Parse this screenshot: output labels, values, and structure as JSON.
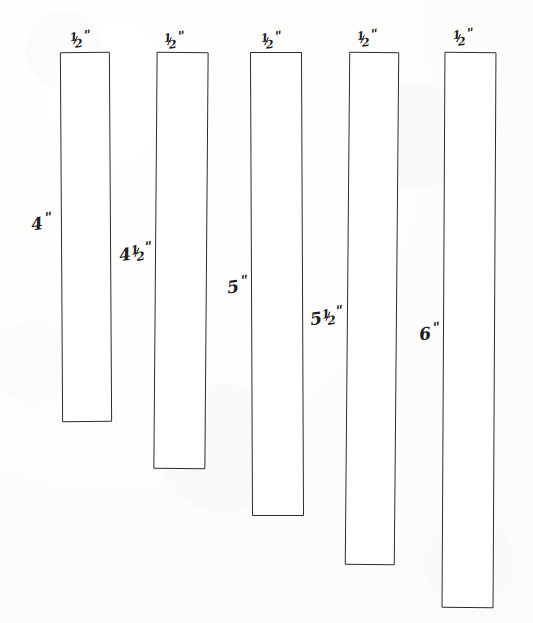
{
  "figure": {
    "kind": "hand-drawn-dimension-diagram",
    "medium": "pen on white paper",
    "background_color": "#fdfdfc",
    "ink_color": "#2b2b2b",
    "fill_color": "#ffffff",
    "units": "inches",
    "inch_symbol": "\"",
    "strip_count": 5,
    "alignment": "top-aligned, increasing length left to right"
  },
  "strips": [
    {
      "index": 1,
      "width_label": "½\"",
      "width_value": 0.5,
      "height_label": "4\"",
      "height_value": 4,
      "width_whole": "",
      "width_num": "1",
      "width_den": "2",
      "height_whole": "4",
      "height_num": "",
      "height_den": "",
      "x": 61,
      "y": 52,
      "w": 50,
      "h": 370
    },
    {
      "index": 2,
      "width_label": "½\"",
      "width_value": 0.5,
      "height_label": "4½\"",
      "height_value": 4.5,
      "width_whole": "",
      "width_num": "1",
      "width_den": "2",
      "height_whole": "4",
      "height_num": "1",
      "height_den": "2",
      "x": 155,
      "y": 52,
      "w": 52,
      "h": 417
    },
    {
      "index": 3,
      "width_label": "½\"",
      "width_value": 0.5,
      "height_label": "5\"",
      "height_value": 5,
      "width_whole": "",
      "width_num": "1",
      "width_den": "2",
      "height_whole": "5",
      "height_num": "",
      "height_den": "",
      "x": 251,
      "y": 52,
      "w": 52,
      "h": 464
    },
    {
      "index": 4,
      "width_label": "½\"",
      "width_value": 0.5,
      "height_label": "5½\"",
      "height_value": 5.5,
      "width_whole": "",
      "width_num": "1",
      "width_den": "2",
      "height_whole": "5",
      "height_num": "1",
      "height_den": "2",
      "x": 347,
      "y": 52,
      "w": 50,
      "h": 513
    },
    {
      "index": 5,
      "width_label": "½\"",
      "width_value": 0.5,
      "height_label": "6\"",
      "height_value": 6,
      "width_whole": "",
      "width_num": "1",
      "width_den": "2",
      "height_whole": "6",
      "height_num": "",
      "height_den": "",
      "x": 443,
      "y": 52,
      "w": 52,
      "h": 556
    }
  ],
  "width_labels": [
    {
      "text": "½\"",
      "x": 70,
      "y": 30,
      "rotate": -7
    },
    {
      "text": "½\"",
      "x": 164,
      "y": 31,
      "rotate": -7
    },
    {
      "text": "½\"",
      "x": 261,
      "y": 31,
      "rotate": -7
    },
    {
      "text": "½\"",
      "x": 357,
      "y": 29,
      "rotate": -7
    },
    {
      "text": "½\"",
      "x": 453,
      "y": 28,
      "rotate": -7
    }
  ],
  "height_labels": [
    {
      "text": "4\"",
      "x": 31,
      "y": 212,
      "rotate": -8
    },
    {
      "text": "4½\"",
      "x": 119,
      "y": 242,
      "rotate": -8
    },
    {
      "text": "5\"",
      "x": 227,
      "y": 275,
      "rotate": -8
    },
    {
      "text": "5½\"",
      "x": 310,
      "y": 306,
      "rotate": -8
    },
    {
      "text": "6\"",
      "x": 419,
      "y": 322,
      "rotate": -8
    }
  ],
  "chart_data": {
    "type": "bar",
    "orientation": "vertical",
    "title": "",
    "xlabel": "",
    "ylabel": "Length (inches)",
    "categories": [
      "Strip 1",
      "Strip 2",
      "Strip 3",
      "Strip 4",
      "Strip 5"
    ],
    "values": [
      4,
      4.5,
      5,
      5.5,
      6
    ],
    "value_labels": [
      "4\"",
      "4½\"",
      "5\"",
      "5½\"",
      "6\""
    ],
    "bar_width_label": "½\"",
    "bar_width_value": 0.5,
    "ylim": [
      0,
      6
    ],
    "grid": false,
    "legend": false
  }
}
